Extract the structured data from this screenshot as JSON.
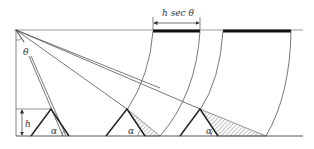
{
  "diagram": {
    "type": "geometric-shadow-diagram",
    "labels": {
      "dimension": "h sec θ",
      "height": "h",
      "angle_theta": "θ",
      "angle_alpha_1": "α",
      "angle_alpha_2": "α",
      "angle_alpha_3": "α"
    },
    "colors": {
      "line": "#555555",
      "thin_line": "#777777",
      "thick_bar": "#111111",
      "triangle": "#222222",
      "hatch": "#666666",
      "text": "#333333"
    },
    "elements": {
      "triangles_count": 3,
      "thick_bars_count": 2,
      "arcs_count": 5,
      "rays_count": 3
    }
  }
}
